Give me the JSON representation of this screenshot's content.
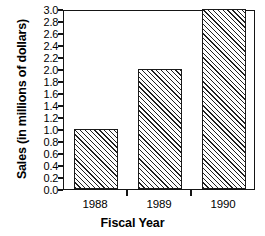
{
  "chart_data": {
    "type": "bar",
    "title": "",
    "xlabel": "Fiscal Year",
    "ylabel": "Sales (in millions of dollars)",
    "categories": [
      "1988",
      "1989",
      "1990"
    ],
    "values": [
      1.0,
      2.0,
      3.0
    ],
    "ylim": [
      0.0,
      3.0
    ],
    "ytick_step": 0.2,
    "ytick_labels": [
      "3.0",
      "2.8",
      "2.6",
      "2.4",
      "2.2",
      "2.0",
      "1.8",
      "1.6",
      "1.4",
      "1.2",
      "1.0",
      "0.8",
      "0.6",
      "0.4",
      "0.2",
      "0.0"
    ],
    "ytick_values": [
      3.0,
      2.8,
      2.6,
      2.4,
      2.2,
      2.0,
      1.8,
      1.6,
      1.4,
      1.2,
      1.0,
      0.8,
      0.6,
      0.4,
      0.2,
      0.0
    ],
    "grid": false,
    "legend": false,
    "bar_fill": "diagonal-hatch",
    "bar_fill_color": "#202020",
    "bar_edge_color": "#1a1a1a",
    "background": "#ffffff"
  }
}
